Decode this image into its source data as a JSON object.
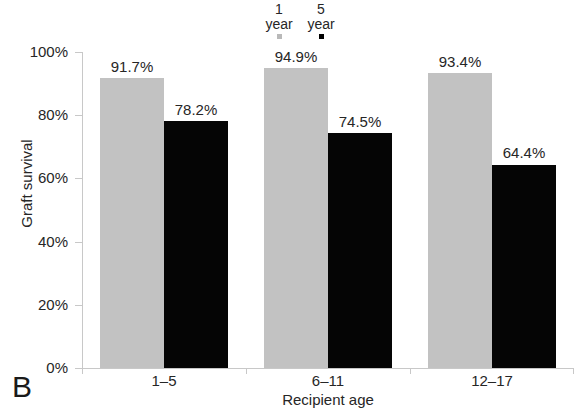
{
  "panel": {
    "letter": "B"
  },
  "legend": {
    "entries": [
      {
        "line1": "1",
        "line2": "year",
        "swatch": "grey-square-marker",
        "color": "#b9b9b9"
      },
      {
        "line1": "5",
        "line2": "year",
        "swatch": "black-square-marker",
        "color": "#000000"
      }
    ]
  },
  "axes": {
    "y_title": "Graft survival",
    "x_title": "Recipient age",
    "y_ticks": [
      "0%",
      "20%",
      "40%",
      "60%",
      "80%",
      "100%"
    ]
  },
  "chart_data": {
    "type": "bar",
    "title": "",
    "xlabel": "Recipient age",
    "ylabel": "Graft survival",
    "ylim": [
      0,
      100
    ],
    "ytick_values": [
      0,
      20,
      40,
      60,
      80,
      100
    ],
    "ytick_labels": [
      "0%",
      "20%",
      "40%",
      "60%",
      "80%",
      "100%"
    ],
    "grid": false,
    "legend_position": "top-center",
    "categories": [
      "1–5",
      "6–11",
      "12–17"
    ],
    "series": [
      {
        "name": "1 year",
        "color": "#c2c2c2",
        "values": [
          91.7,
          94.9,
          93.4
        ],
        "labels": [
          "91.7%",
          "94.9%",
          "93.4%"
        ]
      },
      {
        "name": "5 year",
        "color": "#050505",
        "values": [
          78.2,
          74.5,
          64.4
        ],
        "labels": [
          "78.2%",
          "74.5%",
          "64.4%"
        ]
      }
    ]
  }
}
